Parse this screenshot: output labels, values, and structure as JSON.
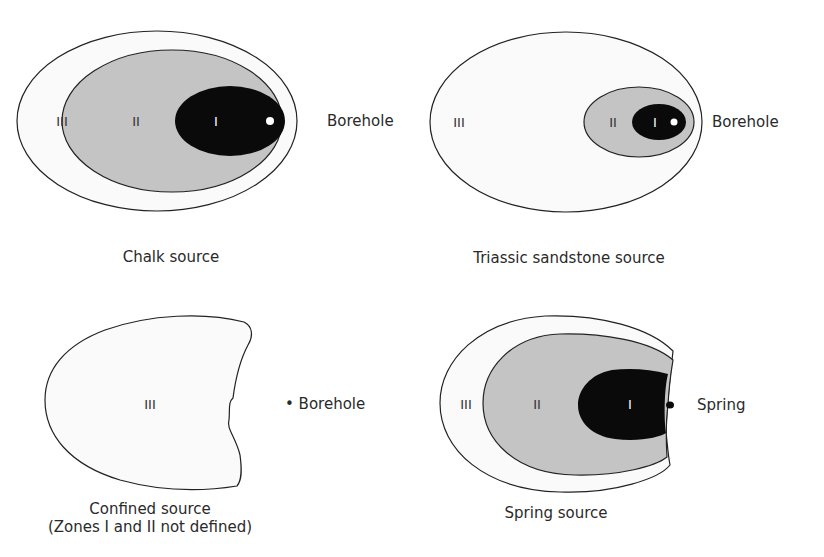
{
  "figure": {
    "panels": [
      {
        "id": "chalk",
        "caption": "Chalk source",
        "zones": {
          "outer": "III",
          "middle": "II",
          "inner": "I"
        },
        "point_label": "Borehole"
      },
      {
        "id": "triassic",
        "caption": "Triassic sandstone source",
        "zones": {
          "outer": "III",
          "middle": "II",
          "inner": "I"
        },
        "point_label": "Borehole"
      },
      {
        "id": "confined",
        "caption": "Confined source",
        "caption_line2": "(Zones I and II not defined)",
        "zones": {
          "outer": "III"
        },
        "point_label": "• Borehole"
      },
      {
        "id": "spring",
        "caption": "Spring source",
        "zones": {
          "outer": "III",
          "middle": "II",
          "inner": "I"
        },
        "point_label": "Spring"
      }
    ],
    "colors": {
      "zone1": "#0a0a0a",
      "zone2": "#c4c4c4",
      "zone3": "#fafafa",
      "outline": "#222222"
    }
  }
}
